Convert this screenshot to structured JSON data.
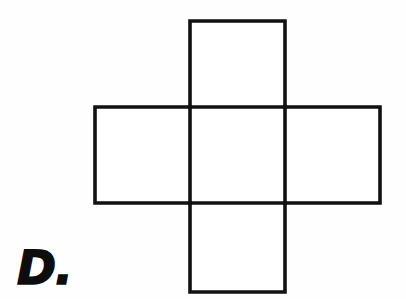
{
  "page": {
    "background_color": "#fefefe",
    "width": 406,
    "height": 299
  },
  "option": {
    "label": "D.",
    "letter": "D",
    "color": "#0d0d0d"
  },
  "figure": {
    "name": "cross-net-of-five-squares",
    "stroke_color": "#111111",
    "fill_color": "#ffffff",
    "stroke_width": 3.6,
    "cell_size": 95,
    "grid": {
      "columns_x": [
        95,
        190,
        285,
        380
      ],
      "rows_y": [
        21,
        107,
        203,
        292
      ]
    },
    "squares": [
      {
        "name": "top-square",
        "x": 190,
        "y": 21,
        "w": 95,
        "h": 86
      },
      {
        "name": "left-square",
        "x": 95,
        "y": 107,
        "w": 95,
        "h": 96
      },
      {
        "name": "center-square",
        "x": 190,
        "y": 107,
        "w": 95,
        "h": 96
      },
      {
        "name": "right-square",
        "x": 285,
        "y": 107,
        "w": 95,
        "h": 96
      },
      {
        "name": "bottom-square",
        "x": 190,
        "y": 203,
        "w": 95,
        "h": 89
      }
    ],
    "outline_path": "M190,21 L285,21 L285,107 L380,107 L380,203 L285,203 L285,292 L190,292 L190,203 L95,203 L95,107 L190,107 Z",
    "inner_lines": [
      {
        "name": "inner-line-top-horizontal",
        "x1": 190,
        "y1": 107,
        "x2": 285,
        "y2": 107
      },
      {
        "name": "inner-line-bottom-horizontal",
        "x1": 190,
        "y1": 203,
        "x2": 285,
        "y2": 203
      },
      {
        "name": "inner-line-left-vertical",
        "x1": 190,
        "y1": 107,
        "x2": 190,
        "y2": 203
      },
      {
        "name": "inner-line-right-vertical",
        "x1": 285,
        "y1": 107,
        "x2": 285,
        "y2": 203
      }
    ]
  }
}
